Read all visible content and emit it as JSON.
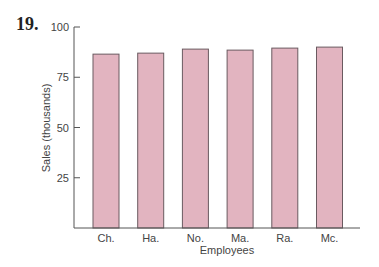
{
  "problem_number": "19.",
  "colors": {
    "bar_fill": "#e2b4c0",
    "bar_stroke": "#6a5a60",
    "axis": "#555555"
  },
  "chart_data": {
    "type": "bar",
    "title": "",
    "xlabel": "Employees",
    "ylabel": "Sales (thousands)",
    "categories": [
      "Ch.",
      "Ha.",
      "No.",
      "Ma.",
      "Ra.",
      "Mc."
    ],
    "values": [
      86.5,
      87,
      89,
      88.5,
      89.5,
      90
    ],
    "ylim": [
      0,
      100
    ],
    "yticks": [
      25,
      50,
      75,
      100
    ],
    "grid": false,
    "legend": null
  }
}
